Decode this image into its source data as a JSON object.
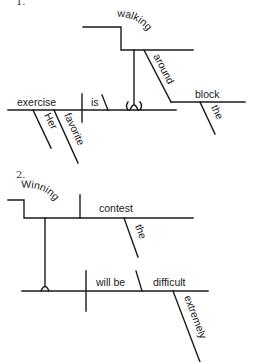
{
  "diagrams": [
    {
      "number": "1.",
      "sentence_words": {
        "subject": "exercise",
        "subject_modifiers": [
          "Her",
          "favorite"
        ],
        "verb": "is",
        "predicate_gerund_phrase": "walking",
        "preposition": "around",
        "object_of_preposition": "block",
        "object_modifier": "the",
        "fork_symbol": "( )"
      }
    },
    {
      "number": "2.",
      "sentence_words": {
        "gerund": "Winning",
        "gerund_object": "contest",
        "gerund_object_modifier": "the",
        "verb": "will be",
        "predicate_adjective": "difficult",
        "adverb": "extremely"
      }
    }
  ],
  "colors": {
    "ink": "#1a1a1a",
    "background": "#ffffff"
  }
}
